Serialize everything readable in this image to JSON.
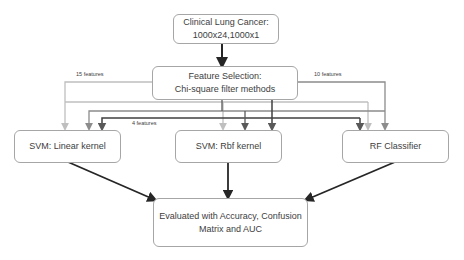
{
  "diagram": {
    "nodes": {
      "input": {
        "line1": "Clinical Lung Cancer:",
        "line2": "1000x24,1000x1"
      },
      "feature_selection": {
        "line1": "Feature Selection:",
        "line2": "Chi-square filter methods"
      },
      "svm_linear": {
        "label": "SVM: Linear kernel"
      },
      "svm_rbf": {
        "label": "SVM: Rbf kernel"
      },
      "rf": {
        "label": "RF Classifier"
      },
      "evaluation": {
        "line1": "Evaluated with Accuracy, Confusion",
        "line2": "Matrix and AUC"
      }
    },
    "edge_labels": {
      "features_15": "15 features",
      "features_10": "10 features",
      "features_4": "4 features"
    },
    "colors": {
      "features_15": "#bfbfbf",
      "features_10": "#8c8c8c",
      "features_4": "#404040",
      "main_flow": "#262626",
      "box_border": "#a6a6a6"
    }
  }
}
